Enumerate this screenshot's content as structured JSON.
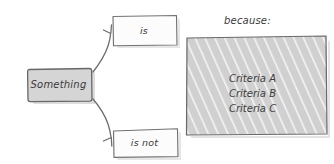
{
  "diagram": {
    "title_text": "",
    "background_color": "#ffffff",
    "ink_color": "#555555",
    "text_color": "#3a3a3a",
    "fill_gray": "#d2d2d2",
    "fill_white": "#fcfcfc",
    "hatch_color": "#f2f2f2",
    "source_node": {
      "label": "Something",
      "shape": "rounded-rectangle",
      "fill": "gray"
    },
    "branches": [
      {
        "label": "is",
        "shape": "rectangle",
        "fill": "white",
        "direction": "up-right"
      },
      {
        "label": "is not",
        "shape": "rectangle",
        "fill": "white",
        "direction": "down-right"
      }
    ],
    "panel": {
      "caption": "because:",
      "fill": "gray-hatched",
      "items": [
        "Criteria A",
        "Criteria B",
        "Criteria C"
      ]
    },
    "connectors": [
      {
        "name": "arrow-to-is",
        "from": "Something",
        "to": "is",
        "style": "curved-arrow"
      },
      {
        "name": "arrow-to-is-not",
        "from": "Something",
        "to": "is not",
        "style": "curved-arrow"
      }
    ]
  }
}
